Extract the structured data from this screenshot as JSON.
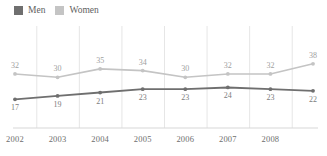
{
  "title_sliver": "",
  "legend": {
    "position": "top-left",
    "items": [
      {
        "label": "Men",
        "color": "#6f6f6f",
        "icon": "square-swatch"
      },
      {
        "label": "Women",
        "color": "#c4c4c4",
        "icon": "square-swatch"
      }
    ]
  },
  "axis": {
    "x_tick_labels": [
      "2002",
      "2003",
      "2004",
      "2005",
      "2006",
      "2007",
      "2008"
    ]
  },
  "chart_data": {
    "type": "line",
    "title": "",
    "subtitle": "",
    "xlabel": "",
    "ylabel": "",
    "grid": "vertical-only",
    "legend_position": "top-left",
    "x": [
      "2002",
      "2003",
      "2004",
      "2005",
      "2006",
      "2007",
      "2008",
      "2009"
    ],
    "x_tick_labels_shown": [
      "2002",
      "2003",
      "2004",
      "2005",
      "2006",
      "2007",
      "2008"
    ],
    "ylim": [
      0,
      45
    ],
    "series": [
      {
        "name": "Men",
        "color": "#6f6f6f",
        "values": [
          17,
          19,
          21,
          23,
          23,
          24,
          23,
          22
        ],
        "label_position": "below"
      },
      {
        "name": "Women",
        "color": "#c4c4c4",
        "values": [
          32,
          30,
          35,
          34,
          30,
          32,
          32,
          38
        ],
        "label_position": "above"
      }
    ]
  }
}
